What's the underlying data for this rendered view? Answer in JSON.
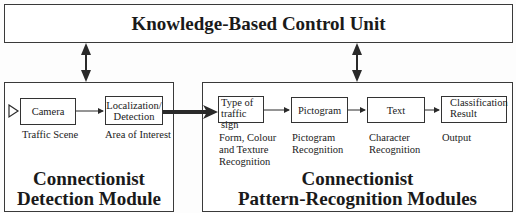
{
  "control_unit": {
    "title": "Knowledge-Based Control Unit"
  },
  "detection_module": {
    "title_line1": "Connectionist",
    "title_line2": "Detection Module",
    "blocks": [
      {
        "label_line1": "Camera",
        "label_line2": "",
        "caption_lines": [
          "Traffic Scene"
        ]
      },
      {
        "label_line1": "Localization/",
        "label_line2": "Detection",
        "caption_lines": [
          "Area of Interest"
        ]
      }
    ]
  },
  "recognition_module": {
    "title_line1": "Connectionist",
    "title_line2": "Pattern-Recognition Modules",
    "blocks": [
      {
        "label_line1": "Type of",
        "label_line2": "traffic sign",
        "caption_lines": [
          "Form, Colour",
          "and Texture",
          "Recognition"
        ]
      },
      {
        "label_line1": "Pictogram",
        "label_line2": "",
        "caption_lines": [
          "Pictogram",
          "Recognition"
        ]
      },
      {
        "label_line1": "Text",
        "label_line2": "",
        "caption_lines": [
          "Character",
          "Recognition"
        ]
      },
      {
        "label_line1": "Classification",
        "label_line2": "Result",
        "caption_lines": [
          "Output"
        ]
      }
    ]
  },
  "colors": {
    "line": "#2a2a2a",
    "background": "#ffffff"
  }
}
